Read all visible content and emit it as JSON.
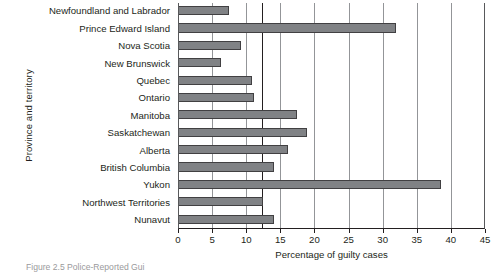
{
  "figure": {
    "caption": "Figure 2.5  Police-Reported Gui",
    "y_axis_title": "Province and territory",
    "x_axis_title": "Percentage of guilty cases"
  },
  "chart_data": {
    "type": "bar",
    "orientation": "horizontal",
    "title": "",
    "xlabel": "Percentage of guilty cases",
    "ylabel": "Province and territory",
    "xlim": [
      0,
      45
    ],
    "xticks": [
      0,
      5,
      10,
      15,
      20,
      25,
      30,
      35,
      40,
      45
    ],
    "xtick_labels": [
      "0",
      "5",
      "10",
      "15",
      "20",
      "25",
      "30",
      "35",
      "40",
      "45"
    ],
    "grid": "vertical",
    "legend": "none",
    "reference_line": {
      "value": 12.3,
      "label": ""
    },
    "categories": [
      "Newfoundland and Labrador",
      "Prince Edward Island",
      "Nova Scotia",
      "New Brunswick",
      "Quebec",
      "Ontario",
      "Manitoba",
      "Saskatchewan",
      "Alberta",
      "British Columbia",
      "Yukon",
      "Northwest Territories",
      "Nunavut"
    ],
    "values": [
      7.5,
      32.0,
      9.2,
      6.3,
      10.9,
      11.2,
      17.5,
      18.9,
      16.1,
      14.1,
      38.6,
      12.5,
      14.1
    ],
    "bar_color": "#808285",
    "bar_edge_color": "#414042"
  }
}
